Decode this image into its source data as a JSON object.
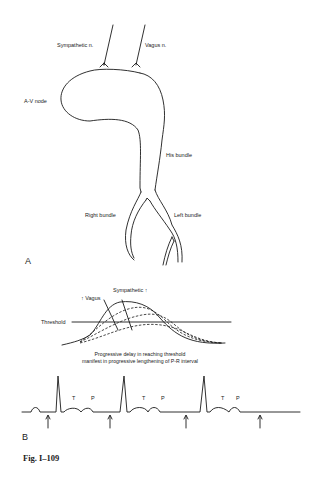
{
  "panel_a": {
    "letter": "A",
    "labels": {
      "sympathetic": "Sympathetic n.",
      "vagus": "Vagus n.",
      "av_node": "A-V node",
      "his_bundle": "His bundle",
      "right_bundle": "Right bundle",
      "left_bundle": "Left bundle"
    }
  },
  "panel_b": {
    "letter": "B",
    "graph_labels": {
      "vagus": "↑ Vagus",
      "sympathetic": "Sympathetic ↑",
      "threshold": "Threshold"
    },
    "caption_line1": "Progressive delay in reaching threshold",
    "caption_line2": "manifest in progressive lengthening of P-R interval",
    "ecg_wave_labels": [
      {
        "t": "T",
        "p": "P"
      },
      {
        "t": "T",
        "p": "P"
      },
      {
        "t": "T",
        "p": "P"
      }
    ],
    "arrow_count": 4
  },
  "figure_label": "Fig. I–109"
}
